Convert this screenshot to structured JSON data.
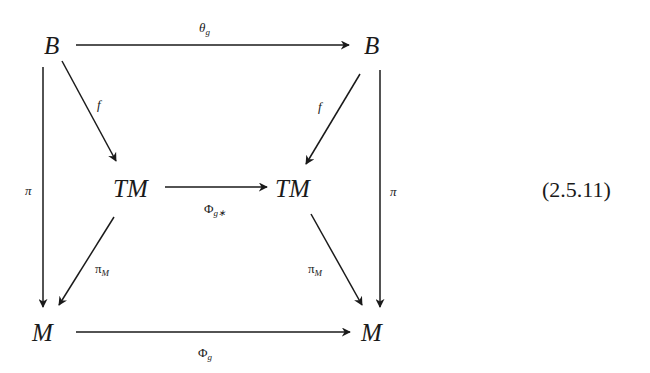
{
  "diagram": {
    "type": "commutative-diagram",
    "equation_number": "(2.5.11)",
    "nodes": {
      "top_left": "B",
      "top_right": "B",
      "mid_left": "TM",
      "mid_right": "TM",
      "bottom_left": "M",
      "bottom_right": "M"
    },
    "arrows": {
      "top": {
        "from": "B",
        "to": "B",
        "label": "θ",
        "label_sub": "g"
      },
      "middle": {
        "from": "TM",
        "to": "TM",
        "label": "Φ",
        "label_sub": "g∗"
      },
      "bottom": {
        "from": "M",
        "to": "M",
        "label": "Φ",
        "label_sub": "g"
      },
      "left_vertical": {
        "from": "B",
        "to": "M",
        "label": "π"
      },
      "right_vertical": {
        "from": "B",
        "to": "M",
        "label": "π"
      },
      "left_diag_top": {
        "from": "B",
        "to": "TM",
        "label": "f"
      },
      "right_diag_top": {
        "from": "B",
        "to": "TM",
        "label": "f"
      },
      "left_diag_bottom": {
        "from": "TM",
        "to": "M",
        "label": "π",
        "label_sub": "M"
      },
      "right_diag_bottom": {
        "from": "TM",
        "to": "M",
        "label": "π",
        "label_sub": "M"
      }
    }
  }
}
